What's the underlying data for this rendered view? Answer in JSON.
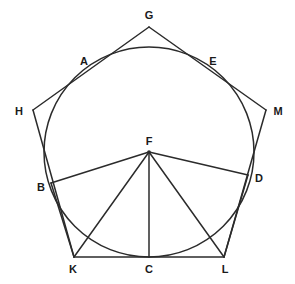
{
  "figure": {
    "background_color": "#ffffff",
    "stroke_color": "#2b2b2b",
    "label_color": "#1a1a1a"
  },
  "circle": {
    "name": "main-circle",
    "cx": 149,
    "cy": 152,
    "r": 105
  },
  "points": [
    {
      "id": "G",
      "label": "G",
      "x": 149,
      "y": 27,
      "label_x": 149,
      "label_y": 15,
      "role": "outer-pentagon-vertex"
    },
    {
      "id": "A",
      "label": "A",
      "x": 95,
      "y": 71,
      "label_x": 84,
      "label_y": 61,
      "role": "circle-point"
    },
    {
      "id": "E",
      "label": "E",
      "x": 204,
      "y": 71,
      "label_x": 213,
      "label_y": 61,
      "role": "circle-point"
    },
    {
      "id": "H",
      "label": "H",
      "x": 33,
      "y": 110,
      "label_x": 19,
      "label_y": 111,
      "role": "outer-pentagon-vertex"
    },
    {
      "id": "M",
      "label": "M",
      "x": 266,
      "y": 110,
      "label_x": 278,
      "label_y": 111,
      "role": "outer-pentagon-vertex"
    },
    {
      "id": "F",
      "label": "F",
      "x": 149,
      "y": 152,
      "label_x": 149,
      "label_y": 141,
      "role": "circle-center"
    },
    {
      "id": "B",
      "label": "B",
      "x": 51,
      "y": 183,
      "label_x": 41,
      "label_y": 187,
      "role": "circle-point"
    },
    {
      "id": "D",
      "label": "D",
      "x": 248,
      "y": 175,
      "label_x": 259,
      "label_y": 178,
      "role": "circle-point"
    },
    {
      "id": "K",
      "label": "K",
      "x": 74,
      "y": 257,
      "label_x": 73,
      "label_y": 269,
      "role": "outer-pentagon-vertex"
    },
    {
      "id": "C",
      "label": "C",
      "x": 149,
      "y": 257,
      "label_x": 149,
      "label_y": 269,
      "role": "circle-point"
    },
    {
      "id": "L",
      "label": "L",
      "x": 224,
      "y": 257,
      "label_x": 225,
      "label_y": 269,
      "role": "outer-pentagon-vertex"
    }
  ],
  "segments": [
    {
      "name": "outer-edge-G-H",
      "from": "G",
      "to": "H"
    },
    {
      "name": "outer-edge-G-M",
      "from": "G",
      "to": "M"
    },
    {
      "name": "outer-edge-H-K",
      "from": "H",
      "to": "K"
    },
    {
      "name": "outer-edge-M-L",
      "from": "M",
      "to": "L"
    },
    {
      "name": "outer-edge-K-L",
      "from": "K",
      "to": "L"
    },
    {
      "name": "radius-F-B",
      "from": "F",
      "to": "B"
    },
    {
      "name": "radius-F-D",
      "from": "F",
      "to": "D"
    },
    {
      "name": "radius-F-C",
      "from": "F",
      "to": "C"
    },
    {
      "name": "segment-F-K",
      "from": "F",
      "to": "K"
    },
    {
      "name": "segment-F-L",
      "from": "F",
      "to": "L"
    },
    {
      "name": "segment-B-K",
      "from": "B",
      "to": "K"
    },
    {
      "name": "segment-D-L",
      "from": "D",
      "to": "L"
    }
  ]
}
